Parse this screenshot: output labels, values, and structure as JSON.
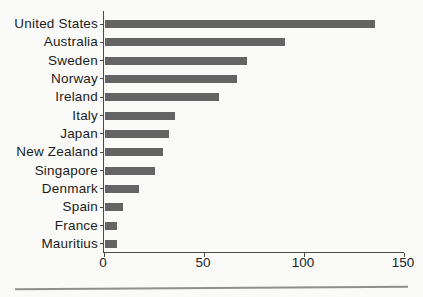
{
  "figure": {
    "background_color": "#fafaf8",
    "bar_color": "#646464",
    "axis_color": "#4a4a4a",
    "label_color": "#1c1c1c",
    "divider_color": "#8f8f8f"
  },
  "chart_data": {
    "type": "bar",
    "orientation": "horizontal",
    "title": "",
    "xlabel": "",
    "ylabel": "",
    "categories": [
      "United States",
      "Australia",
      "Sweden",
      "Norway",
      "Ireland",
      "Italy",
      "Japan",
      "New Zealand",
      "Singapore",
      "Denmark",
      "Spain",
      "France",
      "Mauritius"
    ],
    "values": [
      135,
      90,
      71,
      66,
      57,
      35,
      32,
      29,
      25,
      17,
      9,
      6,
      6
    ],
    "xlim": [
      0,
      150
    ],
    "xticks": [
      0,
      50,
      100,
      150
    ],
    "grid": false,
    "legend": null
  }
}
